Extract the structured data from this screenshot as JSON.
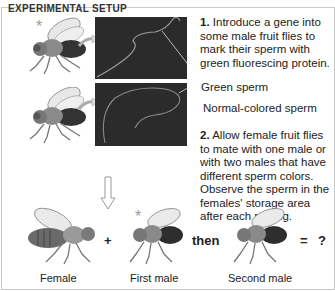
{
  "heading": "EXPERIMENTAL SETUP",
  "step1": {
    "number": "1.",
    "text": " Introduce a gene into some male fruit flies to mark their sperm with green fluorescing protein."
  },
  "labels": {
    "green_sperm": "Green sperm",
    "normal_sperm": "Normal-colored sperm"
  },
  "step2": {
    "number": "2.",
    "text": " Allow female fruit flies to mate with one male or with two males that have different sperm colors. Observe the sperm in the females' storage area after each mating."
  },
  "equation": {
    "plus": "+",
    "then": "then",
    "equals": "=",
    "result": "?",
    "captions": {
      "female": "Female",
      "first_male": "First male",
      "second_male": "Second male"
    }
  },
  "markers": {
    "star": "*"
  },
  "colors": {
    "panel_bg": "#2b2b2b",
    "sperm_line": "#9a9a9a",
    "frame": "#c8c8c8"
  }
}
